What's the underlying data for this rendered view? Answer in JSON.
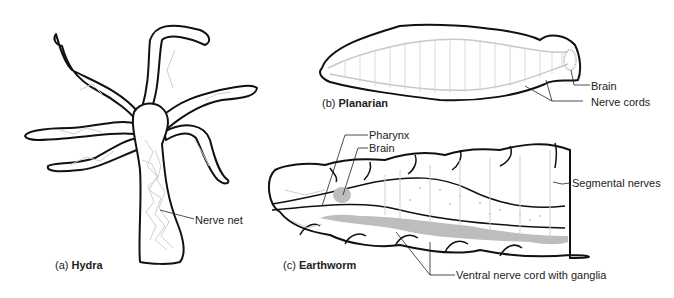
{
  "figures": [
    {
      "id": "a",
      "caption_prefix": "(a)",
      "caption_name": "Hydra",
      "labels": [
        "Nerve net"
      ]
    },
    {
      "id": "b",
      "caption_prefix": "(b)",
      "caption_name": "Planarian",
      "labels": [
        "Brain",
        "Nerve cords"
      ]
    },
    {
      "id": "c",
      "caption_prefix": "(c)",
      "caption_name": "Earthworm",
      "labels": [
        "Pharynx",
        "Brain",
        "Segmental nerves",
        "Ventral nerve cord with ganglia"
      ]
    }
  ],
  "colors": {
    "outline": "#111111",
    "nerve": "#c8c8c8",
    "ganglia": "#bdbdbd"
  }
}
